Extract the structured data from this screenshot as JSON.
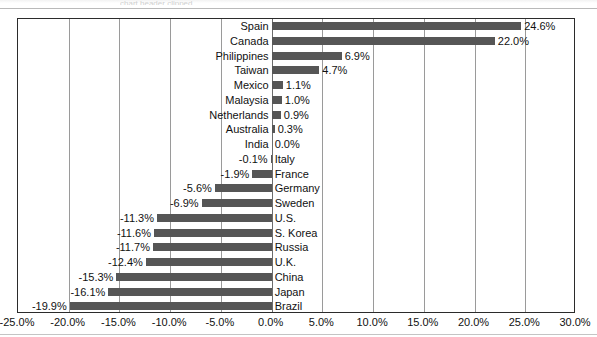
{
  "top_strip": {
    "ghost_text": "chart header clipped"
  },
  "chart_data": {
    "type": "bar",
    "orientation": "horizontal",
    "title": "",
    "subtitle": "",
    "xlabel": "",
    "ylabel": "",
    "xlim": [
      -25.0,
      30.0
    ],
    "xtick_step": 5.0,
    "grid": true,
    "legend": "none",
    "bar_color": "#565656",
    "value_label_suffix": "%",
    "xticks": [
      "-25.0%",
      "-20.0%",
      "-15.0%",
      "-10.0%",
      "-5.0%",
      "0.0%",
      "5.0%",
      "10.0%",
      "15.0%",
      "20.0%",
      "25.0%",
      "30.0%"
    ],
    "xtick_values": [
      -25.0,
      -20.0,
      -15.0,
      -10.0,
      -5.0,
      0.0,
      5.0,
      10.0,
      15.0,
      20.0,
      25.0,
      30.0
    ],
    "categories": [
      "Spain",
      "Canada",
      "Philippines",
      "Taiwan",
      "Mexico",
      "Malaysia",
      "Netherlands",
      "Australia",
      "India",
      "Italy",
      "France",
      "Germany",
      "Sweden",
      "U.S.",
      "S. Korea",
      "Russia",
      "U.K.",
      "China",
      "Japan",
      "Brazil"
    ],
    "values": [
      24.6,
      22.0,
      6.9,
      4.7,
      1.1,
      1.0,
      0.9,
      0.3,
      0.0,
      -0.1,
      -1.9,
      -5.6,
      -6.9,
      -11.3,
      -11.6,
      -11.7,
      -12.4,
      -15.3,
      -16.1,
      -19.9
    ],
    "value_labels": [
      "24.6%",
      "22.0%",
      "6.9%",
      "4.7%",
      "1.1%",
      "1.0%",
      "0.9%",
      "0.3%",
      "0.0%",
      "-0.1%",
      "-1.9%",
      "-5.6%",
      "-6.9%",
      "-11.3%",
      "-11.6%",
      "-11.7%",
      "-12.4%",
      "-15.3%",
      "-16.1%",
      "-19.9%"
    ]
  }
}
